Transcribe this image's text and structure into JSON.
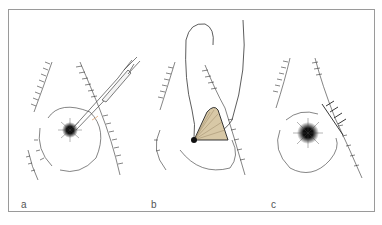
{
  "figure": {
    "panels": [
      {
        "id": "a",
        "label": "a",
        "description": "Scalpel incising at the dark central point surrounded by radiating hatching"
      },
      {
        "id": "b",
        "label": "b",
        "description": "Wound opened with a triangular flap, curved needle and suture passing through"
      },
      {
        "id": "c",
        "label": "c",
        "description": "Closed wound with cross-stitched sutures beside dark central point"
      }
    ],
    "colors": {
      "line": "#222222",
      "frame": "#9a9a9a",
      "flap_fill": "#d8c8a6",
      "accent": "#e8b890"
    }
  }
}
